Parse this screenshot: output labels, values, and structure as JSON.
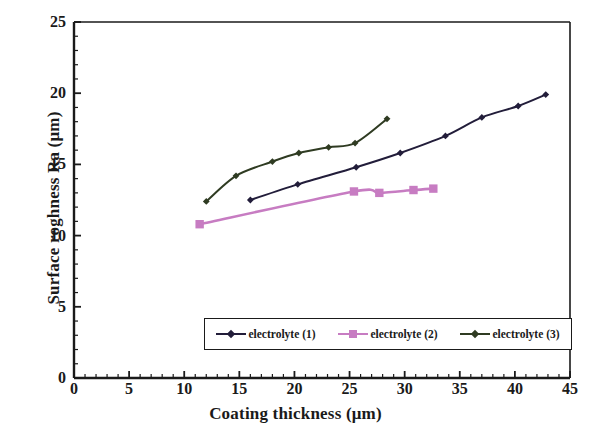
{
  "chart_data": {
    "type": "line",
    "title": "",
    "xlabel": "Coating thickness (μm)",
    "ylabel": "Surface roghness Ra (μm)",
    "xlim": [
      0,
      45
    ],
    "ylim": [
      0,
      25
    ],
    "x_major_ticks": [
      0,
      5,
      10,
      15,
      20,
      25,
      30,
      35,
      40,
      45
    ],
    "y_major_ticks": [
      0,
      5,
      10,
      15,
      20,
      25
    ],
    "x_minor_tick_step": 1,
    "y_minor_tick_step": 1,
    "x_tick_labels": [
      "0",
      "5",
      "10",
      "15",
      "20",
      "25",
      "30",
      "35",
      "40",
      "45"
    ],
    "y_tick_labels": [
      "0",
      "5",
      "10",
      "15",
      "20",
      "25"
    ],
    "grid": false,
    "legend_position": "inside-bottom-center",
    "series": [
      {
        "name": "electrolyte (1)",
        "color": "#221d3a",
        "marker": "diamond",
        "points": [
          {
            "x": 16.0,
            "y": 12.5
          },
          {
            "x": 20.3,
            "y": 13.6
          },
          {
            "x": 25.6,
            "y": 14.8
          },
          {
            "x": 29.6,
            "y": 15.8
          },
          {
            "x": 33.7,
            "y": 17.0
          },
          {
            "x": 37.0,
            "y": 18.3
          },
          {
            "x": 40.3,
            "y": 19.1
          },
          {
            "x": 42.8,
            "y": 19.9
          }
        ]
      },
      {
        "name": "electrolyte (2)",
        "color": "#c77cc2",
        "marker": "square",
        "points": [
          {
            "x": 11.4,
            "y": 10.8
          },
          {
            "x": 25.4,
            "y": 13.1
          },
          {
            "x": 27.7,
            "y": 13.0
          },
          {
            "x": 30.8,
            "y": 13.2
          },
          {
            "x": 32.6,
            "y": 13.3
          }
        ]
      },
      {
        "name": "electrolyte (3)",
        "color": "#2f3b22",
        "marker": "diamond",
        "points": [
          {
            "x": 12.0,
            "y": 12.4
          },
          {
            "x": 14.7,
            "y": 14.2
          },
          {
            "x": 18.0,
            "y": 15.2
          },
          {
            "x": 20.4,
            "y": 15.8
          },
          {
            "x": 23.1,
            "y": 16.2
          },
          {
            "x": 25.5,
            "y": 16.5
          },
          {
            "x": 28.4,
            "y": 18.2
          }
        ]
      }
    ]
  },
  "legend": {
    "entries": [
      {
        "label": "electrolyte (1)",
        "color": "#221d3a",
        "marker": "diamond"
      },
      {
        "label": "electrolyte (2)",
        "color": "#c77cc2",
        "marker": "square"
      },
      {
        "label": "electrolyte (3)",
        "color": "#2f3b22",
        "marker": "diamond"
      }
    ]
  }
}
